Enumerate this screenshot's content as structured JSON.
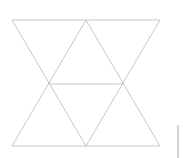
{
  "canvas": {
    "width": 183,
    "height": 158,
    "background_color": "#ffffff"
  },
  "figure": {
    "name": "triangular-lattice",
    "stroke_color": "#b9b9b9",
    "stroke_width": 0.8,
    "fill_color": "none",
    "bounds": {
      "left": 12,
      "top": 20,
      "right": 160,
      "bottom": 146
    },
    "vertices": [
      {
        "id": "top-left",
        "x": 12,
        "y": 20
      },
      {
        "id": "top-center",
        "x": 86,
        "y": 20
      },
      {
        "id": "top-right",
        "x": 160,
        "y": 20
      },
      {
        "id": "mid-left",
        "x": 49,
        "y": 84
      },
      {
        "id": "mid-right",
        "x": 124,
        "y": 84
      },
      {
        "id": "bottom-left",
        "x": 12,
        "y": 146
      },
      {
        "id": "bottom-center",
        "x": 86,
        "y": 146
      },
      {
        "id": "bottom-right",
        "x": 160,
        "y": 146
      }
    ],
    "edges": [
      {
        "id": "top-edge",
        "from": "top-left",
        "to": "top-right"
      },
      {
        "id": "bottom-edge",
        "from": "bottom-left",
        "to": "bottom-right"
      },
      {
        "id": "middle-horizontal",
        "from": "mid-left",
        "to": "mid-right"
      },
      {
        "id": "diag-tl-to-bc",
        "from": "top-left",
        "to": "bottom-center"
      },
      {
        "id": "diag-tc-to-bl",
        "from": "top-center",
        "to": "bottom-left"
      },
      {
        "id": "diag-tc-to-br",
        "from": "top-center",
        "to": "bottom-right"
      },
      {
        "id": "diag-tr-to-bc",
        "from": "top-right",
        "to": "bottom-center"
      }
    ]
  },
  "artifact": {
    "name": "right-edge-line",
    "description": "Faint vertical grey line fragment near right edge",
    "x": 178,
    "y_start": 125,
    "y_end": 158,
    "stroke_color": "#a8a8a8",
    "stroke_width": 1
  }
}
